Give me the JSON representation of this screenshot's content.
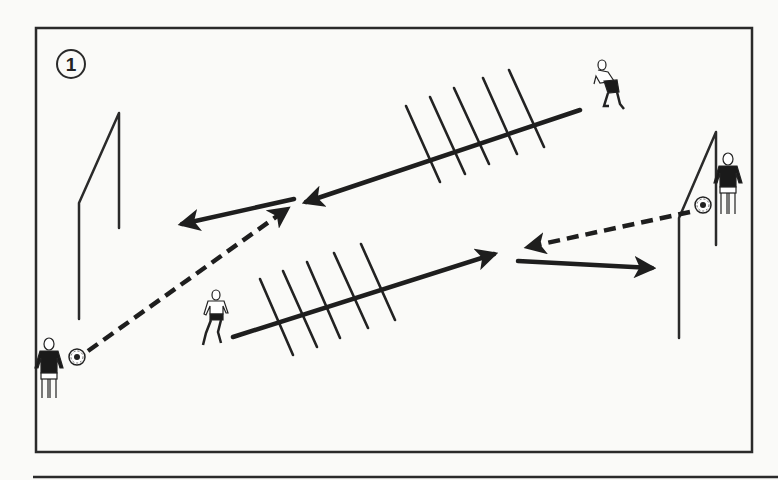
{
  "diagram": {
    "step_number": "1",
    "colors": {
      "line": "#1e1e1e",
      "frame": "#2a2a2a",
      "background": "#fafaf8",
      "jersey_dark": "#1a1a1a"
    },
    "elements": {
      "goals": [
        "left-goal",
        "right-goal"
      ],
      "ladders": [
        "upper-ladder",
        "lower-ladder"
      ],
      "rungs_per_ladder": 5,
      "players": [
        "left-goalkeeper",
        "right-goalkeeper",
        "upper-runner",
        "lower-runner"
      ],
      "balls": [
        "left-ball",
        "right-ball"
      ],
      "arrows": {
        "dashed_pass": [
          "pass-left-to-center",
          "pass-right-to-center"
        ],
        "solid_run": [
          "run-upper-ladder",
          "run-upper-short",
          "run-lower-ladder",
          "run-lower-short"
        ]
      }
    }
  }
}
